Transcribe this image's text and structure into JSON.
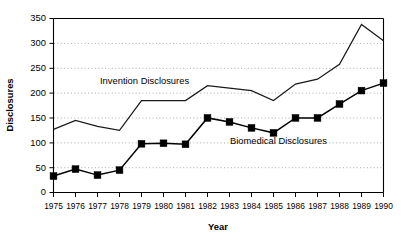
{
  "chart_data": {
    "type": "line",
    "title": "",
    "xlabel": "Year",
    "ylabel": "Disclosures",
    "x": [
      1975,
      1976,
      1977,
      1978,
      1979,
      1980,
      1981,
      1982,
      1983,
      1984,
      1985,
      1986,
      1987,
      1988,
      1989,
      1990
    ],
    "xtick_labels": [
      "1975",
      "1976",
      "1977",
      "1978",
      "1979",
      "1980",
      "1981",
      "1982",
      "1983",
      "1984",
      "1985",
      "1986",
      "1987",
      "1988",
      "1989",
      "1990"
    ],
    "ytick_labels": [
      "0",
      "50",
      "100",
      "150",
      "200",
      "250",
      "300",
      "350"
    ],
    "yticks": [
      0,
      50,
      100,
      150,
      200,
      250,
      300,
      350
    ],
    "ylim": [
      0,
      350
    ],
    "xlim": [
      1975,
      1990
    ],
    "grid": true,
    "legend_position": "inline-annotation",
    "series": [
      {
        "name": "Invention Disclosures",
        "marker": "none",
        "color": "#1a1a1a",
        "values": [
          127,
          145,
          133,
          125,
          185,
          185,
          185,
          215,
          210,
          205,
          185,
          218,
          228,
          258,
          338,
          305
        ]
      },
      {
        "name": "Biomedical Disclosures",
        "marker": "filled-square",
        "color": "#000000",
        "values": [
          33,
          47,
          35,
          45,
          98,
          99,
          97,
          150,
          142,
          130,
          120,
          150,
          150,
          178,
          205,
          220
        ]
      }
    ],
    "annotations": [
      {
        "text": "Invention Disclosures",
        "x": 1977.0,
        "y": 213
      },
      {
        "text": "Biomedical Disclosures",
        "x": 1983.6,
        "y": 93
      }
    ]
  },
  "axes": {
    "y_title": "Disclosures",
    "x_title": "Year"
  }
}
